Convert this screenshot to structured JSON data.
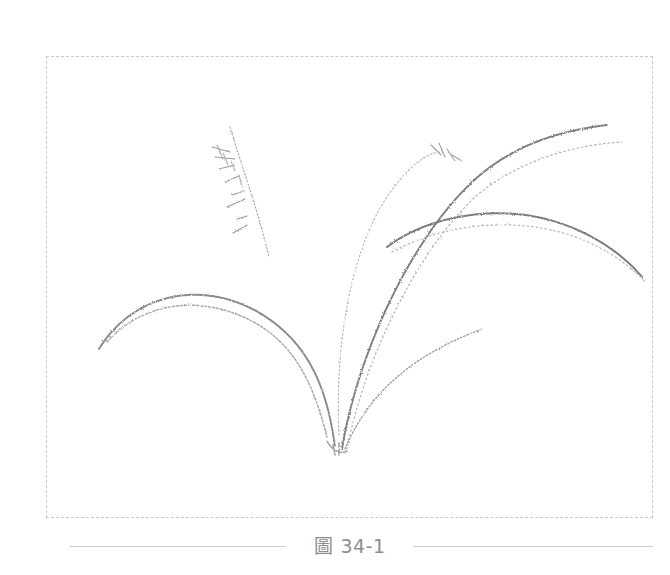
{
  "figure": {
    "caption": "圖 34-1",
    "stroke_color": "#7a7a7a",
    "light_stroke_color": "#b5b5b5",
    "frame_border_color": "#c9c9c9"
  }
}
